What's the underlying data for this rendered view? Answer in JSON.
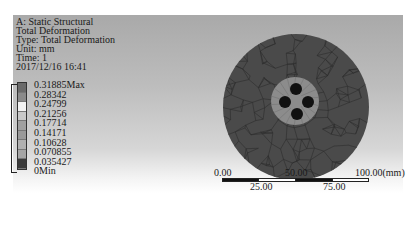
{
  "header": {
    "analysis": "A: Static Structural",
    "result": "Total Deformation",
    "type": "Type: Total Deformation",
    "unit": "Unit: mm",
    "time": "Time: 1",
    "date": "2017/12/16 16:41"
  },
  "legend": {
    "labels": [
      "0.31885Max",
      "0.28342",
      "0.24799",
      "0.21256",
      "0.17714",
      "0.14171",
      "0.10628",
      "0.070855",
      "0.035427",
      "0Min"
    ],
    "band_colors": [
      "#6a6a6a",
      "#8a8a8a",
      "#f2f2f2",
      "#c8c8c8",
      "#a0a0a0",
      "#9a9a9a",
      "#b0b0b0",
      "#a5a5a5",
      "#3a3a3a"
    ]
  },
  "model": {
    "outer_color": "#4a4a4a",
    "inner_ring_color": "#8c8c8c",
    "hole_color": "#111111",
    "mesh_color": "#2e2e2e"
  },
  "scale": {
    "top_labels": [
      "0.00",
      "50.00",
      "100.00(mm)"
    ],
    "bottom_labels": [
      "25.00",
      "75.00"
    ]
  }
}
